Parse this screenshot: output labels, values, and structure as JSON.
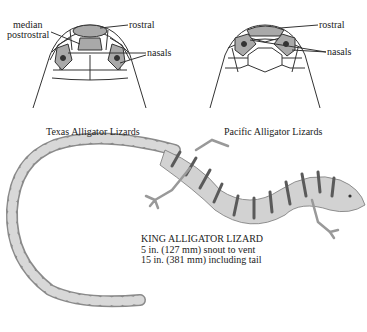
{
  "heads": [
    {
      "caption": "Texas Alligator Lizards",
      "labels": {
        "median": "median",
        "postrostral": "postrostral",
        "rostral": "rostral",
        "nasals": "nasals"
      }
    },
    {
      "caption": "Pacific Alligator Lizards",
      "labels": {
        "rostral": "rostral",
        "nasals": "nasals"
      }
    }
  ],
  "lizard": {
    "name": "KING ALLIGATOR LIZARD",
    "line1": "5 in. (127 mm) snout to vent",
    "line2": "15 in. (381 mm) including tail"
  },
  "footer": {
    "faint_caption": ""
  },
  "colors": {
    "scale_fill": "#a9a9a9",
    "outline": "#333333",
    "band_dark": "#6b6b6b",
    "band_light": "#d8d8d8"
  }
}
